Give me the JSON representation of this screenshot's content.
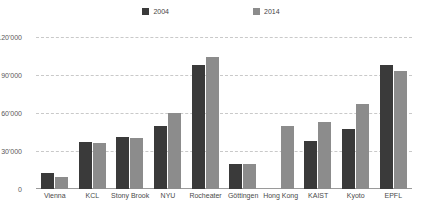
{
  "chart_data": {
    "type": "bar",
    "title": "",
    "subtitle": "",
    "xlabel": "",
    "ylabel": "",
    "ylim": [
      0,
      120000
    ],
    "yticks": [
      0,
      30000,
      60000,
      90000,
      120000
    ],
    "ytick_labels": [
      "0",
      "30'000",
      "60'000",
      "90'000",
      "120'000"
    ],
    "grid": true,
    "legend_position": "top-center",
    "categories": [
      "Vienna",
      "KCL",
      "Stony Brook",
      "NYU",
      "Rocheater",
      "Göttingen",
      "Hong Kong",
      "KAIST",
      "Kyoto",
      "EPFL"
    ],
    "series": [
      {
        "name": "2004",
        "color": "#3a3a3a",
        "values": [
          13000,
          37000,
          41000,
          50000,
          98000,
          20000,
          null,
          38000,
          47000,
          98000
        ]
      },
      {
        "name": "2014",
        "color": "#8c8c8c",
        "values": [
          9500,
          36000,
          40000,
          60000,
          104000,
          20000,
          50000,
          53000,
          67000,
          93000
        ]
      }
    ]
  },
  "colors": {
    "series_2004": "#3a3a3a",
    "series_2014": "#8c8c8c",
    "gridline": "#c9c9c9",
    "axis": "#9a9a9a",
    "text": "#4a4a4a",
    "background": "#ffffff"
  }
}
